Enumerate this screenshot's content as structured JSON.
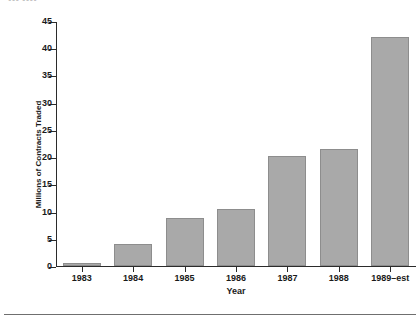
{
  "clipped_header": "▪▪▪  ▪▪▪▪",
  "chart_data": {
    "type": "bar",
    "title": "",
    "xlabel": "Year",
    "ylabel": "Millions of Contracts Traded",
    "categories": [
      "1983",
      "1984",
      "1985",
      "1986",
      "1987",
      "1988",
      "1989–est"
    ],
    "values": [
      0.5,
      4.0,
      8.8,
      10.5,
      20.2,
      21.5,
      42.1
    ],
    "ylim": [
      0,
      45
    ],
    "ytick_labels": [
      "0",
      "5",
      "10",
      "15",
      "20",
      "25",
      "30",
      "35",
      "40",
      "45"
    ],
    "ytick_values": [
      0,
      5,
      10,
      15,
      20,
      25,
      30,
      35,
      40,
      45
    ],
    "grid": false,
    "legend": false,
    "bar_color": "#a9a9a9",
    "axis_color": "#2b2b2b"
  }
}
